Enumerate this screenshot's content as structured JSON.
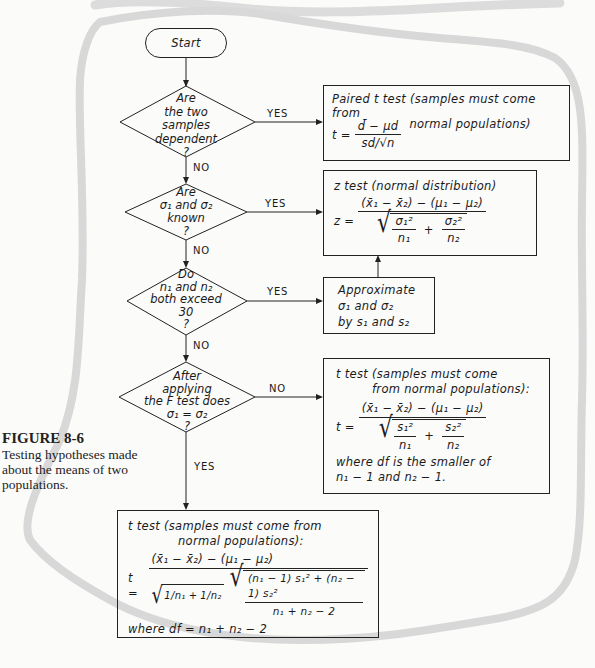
{
  "caption": {
    "figure_label": "FIGURE 8-6",
    "text": "Testing hypotheses made about the means of two populations."
  },
  "flowchart": {
    "start": {
      "label": "Start"
    },
    "decisions": [
      {
        "id": "d1",
        "lines": [
          "Are",
          "the two",
          "samples",
          "dependent",
          "?"
        ],
        "yes_label": "YES",
        "no_label": "NO"
      },
      {
        "id": "d2",
        "lines": [
          "Are",
          "σ₁ and σ₂",
          "known",
          "?"
        ],
        "yes_label": "YES",
        "no_label": "NO"
      },
      {
        "id": "d3",
        "lines": [
          "Do",
          "n₁ and n₂",
          "both exceed",
          "30",
          "?"
        ],
        "yes_label": "YES",
        "no_label": "NO"
      },
      {
        "id": "d4",
        "lines": [
          "After",
          "applying",
          "the F test does",
          "σ₁ = σ₂",
          "?"
        ],
        "yes_label": "YES",
        "no_label": "NO"
      }
    ],
    "results": {
      "paired_t": {
        "title": "Paired t test (samples must come from",
        "title2": "normal populations)",
        "lhs": "t =",
        "numerator": "d̄ − μd",
        "denominator": "sd/√n"
      },
      "z_test": {
        "title": "z test (normal distribution)",
        "lhs": "z =",
        "numerator": "(x̄₁ − x̄₂) − (μ₁ − μ₂)",
        "den_term1_num": "σ₁²",
        "den_term1_den": "n₁",
        "plus": "+",
        "den_term2_num": "σ₂²",
        "den_term2_den": "n₂"
      },
      "approximate": {
        "lines": [
          "Approximate",
          "σ₁ and σ₂",
          "by s₁ and s₂"
        ]
      },
      "t_unequal": {
        "title": "t test (samples must come",
        "title2": "from normal populations):",
        "lhs": "t =",
        "numerator": "(x̄₁ − x̄₂) − (μ₁ − μ₂)",
        "den_term1_num": "s₁²",
        "den_term1_den": "n₁",
        "plus": "+",
        "den_term2_num": "s₂²",
        "den_term2_den": "n₂",
        "note1": "where df is the smaller of",
        "note2": "n₁ − 1 and n₂ − 1."
      },
      "t_pooled": {
        "title": "t test (samples must come from",
        "title2": "normal populations):",
        "lhs": "t =",
        "numerator": "(x̄₁ − x̄₂) − (μ₁ − μ₂)",
        "inv_n1": "1/n₁",
        "inv_plus": "+",
        "inv_n2": "1/n₂",
        "pooled_num": "(n₁ − 1) s₁² + (n₂ − 1) s₂²",
        "pooled_den": "n₁ + n₂ − 2",
        "note": "where df = n₁ + n₂ − 2"
      }
    }
  },
  "colors": {
    "ink": "#1a1a1a",
    "paper": "#fbfbfa",
    "decor_band": "#d9d9d9"
  }
}
